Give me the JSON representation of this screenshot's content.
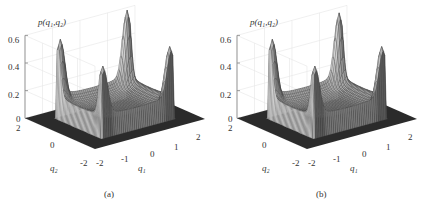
{
  "chart_data": [
    {
      "type": "surface3d",
      "panel_label": "(a)",
      "title": "",
      "zlabel": "p(q1,q2)",
      "xlabel": "q1",
      "ylabel": "q2",
      "xlim": [
        -2,
        2
      ],
      "ylim": [
        -2,
        2
      ],
      "zlim": [
        0,
        0.6
      ],
      "xticks": [
        "-2",
        "-1",
        "0",
        "1",
        "2"
      ],
      "yticks": [
        "-2",
        "0",
        "2"
      ],
      "zticks": [
        "0",
        "0.2",
        "0.4",
        "0.6"
      ],
      "grid": true,
      "peaks": [
        {
          "q1": -1.2,
          "q2": 1.2,
          "height": 0.5
        },
        {
          "q1": 1.2,
          "q2": 1.2,
          "height": 0.58
        },
        {
          "q1": 1.2,
          "q2": -1.2,
          "height": 0.45
        },
        {
          "q1": -1.2,
          "q2": -1.2,
          "height": 0.44
        }
      ],
      "description": "Four-peaked probability density with sharp peaks at the corners of a square plateau, surface edges along |q1|≈1.3, |q2|≈1.3"
    },
    {
      "type": "surface3d",
      "panel_label": "(b)",
      "title": "",
      "zlabel": "p(q1,q2)",
      "xlabel": "q1",
      "ylabel": "q2",
      "xlim": [
        -2,
        2
      ],
      "ylim": [
        -2,
        2
      ],
      "zlim": [
        0,
        0.6
      ],
      "xticks": [
        "-2",
        "-1",
        "0",
        "1",
        "2"
      ],
      "yticks": [
        "-2",
        "0",
        "2"
      ],
      "zticks": [
        "0",
        "0.2",
        "0.4",
        "0.6"
      ],
      "grid": true,
      "peaks": [
        {
          "q1": -1.2,
          "q2": 1.2,
          "height": 0.5
        },
        {
          "q1": 1.2,
          "q2": 1.2,
          "height": 0.56
        },
        {
          "q1": 1.2,
          "q2": -1.2,
          "height": 0.45
        },
        {
          "q1": -1.2,
          "q2": -1.2,
          "height": 0.44
        }
      ],
      "description": "Similar four-peaked density, slightly smoother surface"
    }
  ],
  "panels": [
    {
      "zlabel": "p(q₁,q₂)",
      "xlabel": "q₁",
      "ylabel": "q₂",
      "caption": "(a)",
      "zticks": [
        "0.6",
        "0.4",
        "0.2",
        "0"
      ],
      "xticks": [
        "-2",
        "-1",
        "0",
        "1",
        "2"
      ],
      "yticks": [
        "2",
        "0",
        "-2"
      ]
    },
    {
      "zlabel": "p(q₁,q₂)",
      "xlabel": "q₁",
      "ylabel": "q₂",
      "caption": "(b)",
      "zticks": [
        "0.6",
        "0.4",
        "0.2",
        "0"
      ],
      "xticks": [
        "-2",
        "-1",
        "0",
        "1",
        "2"
      ],
      "yticks": [
        "2",
        "0",
        "-2"
      ]
    }
  ],
  "colors": {
    "surface_light": "#d8d8d8",
    "surface_dark": "#5a5a5a",
    "floor": "#2b2b2b",
    "axis": "#888888",
    "grid": "#e6e6e6",
    "text": "#333333"
  }
}
